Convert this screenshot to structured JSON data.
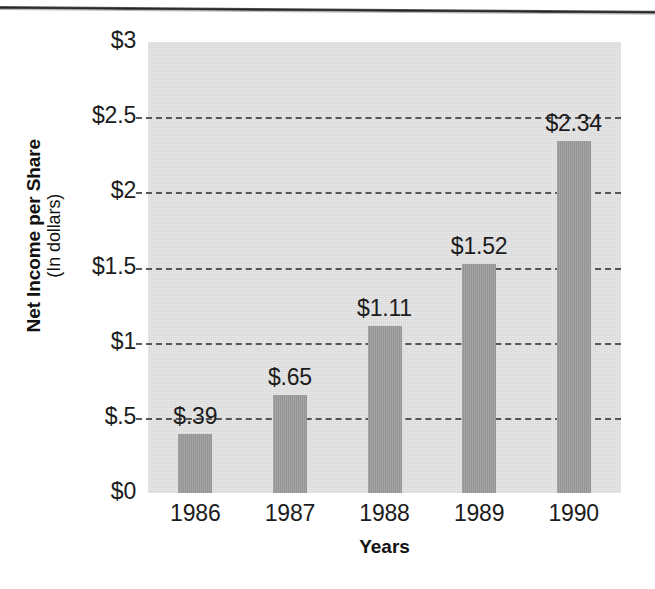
{
  "chart_data": {
    "type": "bar",
    "title": "",
    "xlabel": "Years",
    "ylabel": "Net Income per Share",
    "ylabel_sub": "(In dollars)",
    "categories": [
      "1986",
      "1987",
      "1988",
      "1989",
      "1990"
    ],
    "values": [
      0.39,
      0.65,
      1.11,
      1.52,
      2.34
    ],
    "value_labels": [
      "$.39",
      "$.65",
      "$1.11",
      "$1.52",
      "$2.34"
    ],
    "ylim": [
      0,
      3
    ],
    "ytick_values": [
      0,
      0.5,
      1,
      1.5,
      2,
      2.5,
      3
    ],
    "ytick_labels": [
      "$0",
      "$.5",
      "$1",
      "$1.5",
      "$2",
      "$2.5",
      "$3"
    ],
    "grid": "horizontal-dashed",
    "legend": "none",
    "colors": {
      "bar": "#9b9b9b",
      "plot_background": "#d9d9d9",
      "gridline": "#3d3d3d",
      "text": "#1c1c1c",
      "page_background": "#ffffff",
      "scan_line": "#1a1a1a"
    }
  },
  "artifacts": {
    "top_scan_line": "horizontal-scan-line"
  }
}
